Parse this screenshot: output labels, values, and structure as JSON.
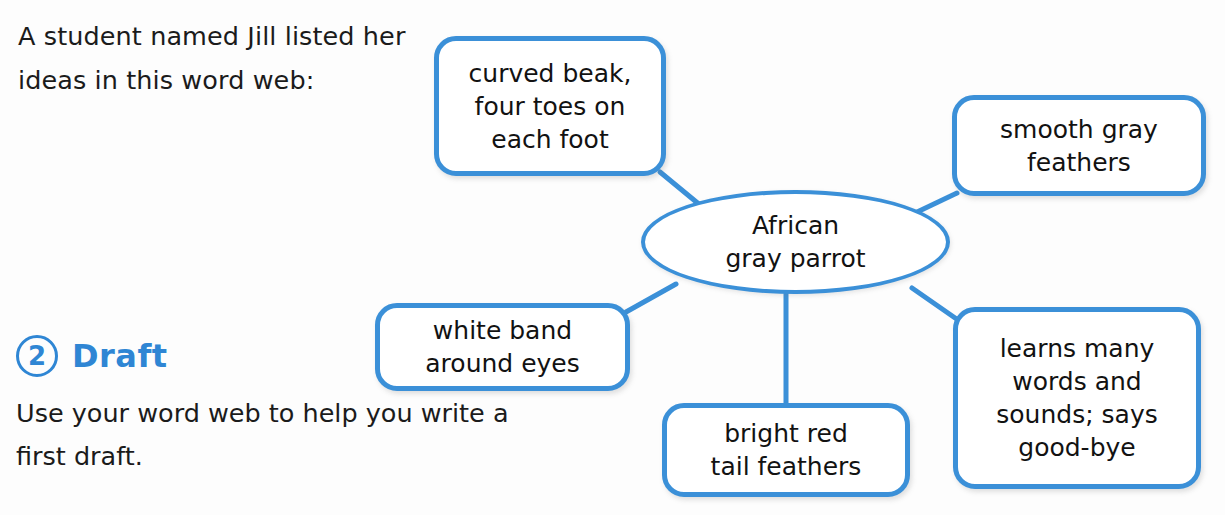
{
  "intro": {
    "text": "A student named Jill listed her ideas in this word web:"
  },
  "step": {
    "number": "2",
    "label": "Draft",
    "body": "Use your word web to help you write a first draft."
  },
  "colors": {
    "accent_blue": "#3b90d8",
    "heading_blue": "#2f86d4",
    "text_black": "#121212",
    "page_background": "#fdfdfd"
  },
  "word_web": {
    "center": {
      "id": "center",
      "label": "African\ngray parrot",
      "line1": "African",
      "line2": "gray parrot",
      "shape": "ellipse"
    },
    "nodes": [
      {
        "id": "curved-beak",
        "shape": "rounded-rect",
        "position": "top-left",
        "lines": [
          "curved beak,",
          "four toes on",
          "each foot"
        ]
      },
      {
        "id": "smooth-gray-feathers",
        "shape": "rounded-rect",
        "position": "top-right",
        "lines": [
          "smooth gray",
          "feathers"
        ]
      },
      {
        "id": "white-band",
        "shape": "rounded-rect",
        "position": "left",
        "lines": [
          "white band",
          "around eyes"
        ]
      },
      {
        "id": "bright-red-tail",
        "shape": "rounded-rect",
        "position": "bottom",
        "lines": [
          "bright red",
          "tail feathers"
        ]
      },
      {
        "id": "learns-words",
        "shape": "rounded-rect",
        "position": "bottom-right",
        "lines": [
          "learns many",
          "words and",
          "sounds; says",
          "good-bye"
        ]
      }
    ],
    "connector_count": "5"
  }
}
